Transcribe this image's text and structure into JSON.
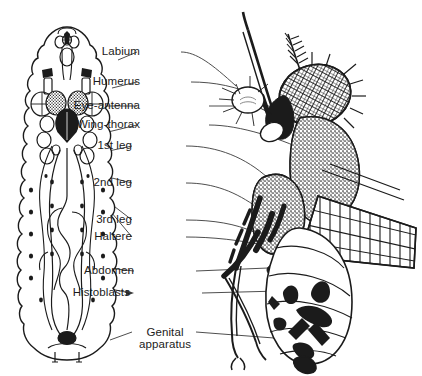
{
  "figure": {
    "background_color": "#ffffff",
    "ink_color": "#1b1b1b",
    "text_color": "#1b1b1b",
    "leader_line_color": "#3a3a3a",
    "left_panel_name": "third-instar larva with imaginal discs",
    "right_panel_name": "adult fly",
    "label_font_size_px": 11.5
  },
  "labels": [
    {
      "id": "labium",
      "text": "Labium",
      "x": 140,
      "y": 48,
      "align": "right",
      "lines": 1
    },
    {
      "id": "humerus",
      "text": "Humerus",
      "x": 140,
      "y": 78,
      "align": "right",
      "lines": 1
    },
    {
      "id": "eye-antenna",
      "text": "Eye-antenna",
      "x": 140,
      "y": 102,
      "align": "right",
      "lines": 1
    },
    {
      "id": "wing-thorax",
      "text": "Wing-thorax",
      "x": 140,
      "y": 121,
      "align": "right",
      "lines": 1
    },
    {
      "id": "leg1",
      "text": "1st leg",
      "x": 140,
      "y": 142,
      "align": "right",
      "lines": 1
    },
    {
      "id": "leg2",
      "text": "2nd leg",
      "x": 140,
      "y": 179,
      "align": "right",
      "lines": 1
    },
    {
      "id": "leg3",
      "text": "3rd leg",
      "x": 140,
      "y": 216,
      "align": "right",
      "lines": 1
    },
    {
      "id": "haltere",
      "text": "Haltere",
      "x": 140,
      "y": 233,
      "align": "right",
      "lines": 1
    },
    {
      "id": "abdomen",
      "text": "Abdomen",
      "x": 140,
      "y": 267,
      "align": "right",
      "lines": 1
    },
    {
      "id": "histoblasts",
      "text": "Histoblasts",
      "x": 140,
      "y": 289,
      "align": "right",
      "lines": 1
    },
    {
      "id": "genital",
      "text": "Genital\napparatus",
      "x": 140,
      "y": 329,
      "align": "center",
      "lines": 2
    }
  ],
  "label_texts": {
    "labium": "Labium",
    "humerus": "Humerus",
    "eye_antenna": "Eye-antenna",
    "wing_thorax": "Wing-thorax",
    "leg1": "1st leg",
    "leg2": "2nd leg",
    "leg3": "3rd leg",
    "haltere": "Haltere",
    "abdomen": "Abdomen",
    "histoblasts": "Histoblasts",
    "genital_line1": "Genital",
    "genital_line2": "apparatus"
  },
  "larva_parts": [
    "cuticle-outline",
    "mouth-hooks",
    "labial-disc",
    "humeral-disc",
    "eye-antennal-disc",
    "wing-disc",
    "first-leg-disc",
    "second-leg-disc",
    "third-leg-disc",
    "haltere-disc",
    "abdominal-histoblasts",
    "genital-disc",
    "gut",
    "posterior-spiracles"
  ],
  "adult_parts": [
    "arista",
    "antenna",
    "compound-eye",
    "proboscis",
    "humerus",
    "thorax",
    "wing",
    "foreleg",
    "midleg",
    "hindleg",
    "haltere",
    "abdomen-segments",
    "genitalia"
  ]
}
